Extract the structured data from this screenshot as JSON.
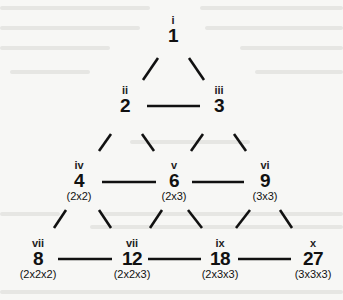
{
  "diagram": {
    "title": "",
    "nodes": [
      {
        "id": "n1",
        "label": "i",
        "value": "1",
        "factors": ""
      },
      {
        "id": "n2",
        "label": "ii",
        "value": "2",
        "factors": ""
      },
      {
        "id": "n3",
        "label": "iii",
        "value": "3",
        "factors": ""
      },
      {
        "id": "n4",
        "label": "iv",
        "value": "4",
        "factors": "(2x2)"
      },
      {
        "id": "n6",
        "label": "v",
        "value": "6",
        "factors": "(2x3)"
      },
      {
        "id": "n9",
        "label": "vi",
        "value": "9",
        "factors": "(3x3)"
      },
      {
        "id": "n8",
        "label": "vii",
        "value": "8",
        "factors": "(2x2x2)"
      },
      {
        "id": "n12",
        "label": "vii",
        "value": "12",
        "factors": "(2x2x3)"
      },
      {
        "id": "n18",
        "label": "ix",
        "value": "18",
        "factors": "(2x3x3)"
      },
      {
        "id": "n27",
        "label": "x",
        "value": "27",
        "factors": "(3x3x3)"
      }
    ],
    "edges": [
      [
        "n1",
        "n2"
      ],
      [
        "n1",
        "n3"
      ],
      [
        "n2",
        "n3"
      ],
      [
        "n2",
        "n4"
      ],
      [
        "n2",
        "n6"
      ],
      [
        "n3",
        "n6"
      ],
      [
        "n3",
        "n9"
      ],
      [
        "n4",
        "n6"
      ],
      [
        "n6",
        "n9"
      ],
      [
        "n4",
        "n8"
      ],
      [
        "n4",
        "n12"
      ],
      [
        "n6",
        "n12"
      ],
      [
        "n6",
        "n18"
      ],
      [
        "n9",
        "n18"
      ],
      [
        "n9",
        "n27"
      ],
      [
        "n8",
        "n12"
      ],
      [
        "n12",
        "n18"
      ],
      [
        "n18",
        "n27"
      ]
    ]
  }
}
